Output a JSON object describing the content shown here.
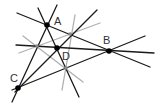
{
  "diagram": {
    "colors": {
      "black_line": "#1a1a1a",
      "gray_line": "#b0b0b0",
      "point": "#000000",
      "label": "#333333",
      "background": "#ffffff"
    },
    "points": [
      {
        "id": "A",
        "label": "A",
        "x": 47,
        "y": 25,
        "label_x": 54,
        "label_y": 25,
        "style": "black"
      },
      {
        "id": "B",
        "label": "B",
        "x": 109,
        "y": 51,
        "label_x": 103,
        "label_y": 44,
        "style": "black"
      },
      {
        "id": "C",
        "label": "C",
        "x": 18,
        "y": 88,
        "label_x": 10,
        "label_y": 82,
        "style": "black"
      },
      {
        "id": "D",
        "label": "D",
        "x": 57,
        "y": 48,
        "label_x": 62,
        "label_y": 60,
        "style": "black"
      },
      {
        "id": "P1",
        "label": "",
        "x": 70,
        "y": 34,
        "style": "gray"
      },
      {
        "id": "P2",
        "label": "",
        "x": 37,
        "y": 46,
        "style": "gray"
      },
      {
        "id": "P3",
        "label": "",
        "x": 66,
        "y": 68,
        "style": "gray"
      }
    ],
    "black_lines": [
      {
        "x1": 17,
        "y1": 13,
        "x2": 150,
        "y2": 67
      },
      {
        "x1": 57,
        "y1": 5,
        "x2": 12,
        "y2": 102
      },
      {
        "x1": 38,
        "y1": 8,
        "x2": 79,
        "y2": 97
      },
      {
        "x1": 12,
        "y1": 90,
        "x2": 145,
        "y2": 36
      },
      {
        "x1": 16,
        "y1": 45,
        "x2": 154,
        "y2": 53
      },
      {
        "x1": 15,
        "y1": 92,
        "x2": 97,
        "y2": 10
      }
    ],
    "gray_lines": [
      {
        "x1": 23,
        "y1": 36,
        "x2": 83,
        "y2": 82
      },
      {
        "x1": 19,
        "y1": 53,
        "x2": 100,
        "y2": 23
      },
      {
        "x1": 75,
        "y1": 15,
        "x2": 62,
        "y2": 90
      }
    ]
  }
}
